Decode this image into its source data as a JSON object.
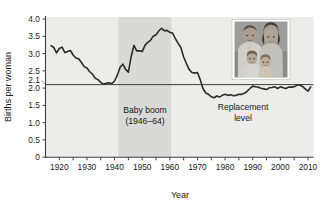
{
  "chart_data": {
    "type": "line",
    "title": "",
    "xlabel": "Year",
    "ylabel": "Births per woman",
    "xlim": [
      1915,
      2012
    ],
    "ylim": [
      0,
      4.1
    ],
    "grid": false,
    "legend": "none",
    "xticks_major": [
      1920,
      1930,
      1940,
      1950,
      1960,
      1970,
      1980,
      1990,
      2000,
      2010
    ],
    "xticks_minor": [
      1925,
      1935,
      1945,
      1955,
      1965,
      1975,
      1985,
      1995,
      2005
    ],
    "xtick_labels": [
      "1920",
      "1930",
      "1940",
      "1950",
      "1960",
      "1970",
      "1980",
      "1990",
      "2000",
      "2010"
    ],
    "yticks": [
      0,
      0.5,
      1.0,
      1.5,
      2.0,
      2.1,
      2.5,
      3.0,
      3.5,
      4.0
    ],
    "ytick_labels": [
      "0",
      "0.5",
      "1.0",
      "1.5",
      "2.0",
      "2.1",
      "2.5",
      "3.0",
      "3.5",
      "4.0"
    ],
    "series": [
      {
        "name": "Total fertility rate",
        "x": [
          1917,
          1918,
          1919,
          1920,
          1921,
          1922,
          1923,
          1924,
          1925,
          1926,
          1927,
          1928,
          1929,
          1930,
          1931,
          1932,
          1933,
          1934,
          1935,
          1936,
          1937,
          1938,
          1939,
          1940,
          1941,
          1942,
          1943,
          1944,
          1945,
          1946,
          1947,
          1948,
          1949,
          1950,
          1951,
          1952,
          1953,
          1954,
          1955,
          1956,
          1957,
          1958,
          1959,
          1960,
          1961,
          1962,
          1963,
          1964,
          1965,
          1966,
          1967,
          1968,
          1969,
          1970,
          1971,
          1972,
          1973,
          1974,
          1975,
          1976,
          1977,
          1978,
          1979,
          1980,
          1981,
          1982,
          1983,
          1984,
          1985,
          1986,
          1987,
          1988,
          1989,
          1990,
          1991,
          1992,
          1993,
          1994,
          1995,
          1996,
          1997,
          1998,
          1999,
          2000,
          2001,
          2002,
          2003,
          2004,
          2005,
          2006,
          2007,
          2008,
          2009,
          2010,
          2011
        ],
        "y": [
          3.26,
          3.21,
          3.05,
          3.18,
          3.22,
          3.06,
          3.09,
          3.12,
          2.99,
          2.9,
          2.88,
          2.77,
          2.65,
          2.61,
          2.5,
          2.43,
          2.31,
          2.27,
          2.19,
          2.14,
          2.16,
          2.18,
          2.15,
          2.23,
          2.4,
          2.63,
          2.72,
          2.57,
          2.49,
          2.94,
          3.27,
          3.11,
          3.11,
          3.09,
          3.27,
          3.36,
          3.42,
          3.54,
          3.58,
          3.69,
          3.77,
          3.7,
          3.71,
          3.65,
          3.63,
          3.47,
          3.33,
          3.21,
          2.93,
          2.74,
          2.57,
          2.48,
          2.46,
          2.48,
          2.27,
          2.01,
          1.88,
          1.84,
          1.77,
          1.74,
          1.79,
          1.76,
          1.81,
          1.84,
          1.81,
          1.83,
          1.8,
          1.81,
          1.84,
          1.84,
          1.87,
          1.93,
          2.01,
          2.08,
          2.06,
          2.05,
          2.02,
          2.0,
          1.98,
          2.03,
          2.04,
          2.06,
          2.01,
          2.06,
          2.03,
          2.01,
          2.05,
          2.05,
          2.06,
          2.11,
          2.12,
          2.07,
          2.0,
          1.93,
          2.06
        ]
      }
    ],
    "reference_lines": [
      {
        "name": "replacement-level",
        "orientation": "horizontal",
        "value": 2.1,
        "label": "2.1"
      }
    ],
    "shaded_regions": [
      {
        "name": "baby-boom-band",
        "x_start": 1946,
        "x_end": 1964,
        "label": "Baby boom",
        "sublabel": "(1946–64)"
      }
    ],
    "annotations": [
      {
        "name": "baby-boom-annotation",
        "line1": "Baby boom",
        "line2": "(1946–64)"
      },
      {
        "name": "replacement-annotation",
        "line1": "Replacement",
        "line2": "level"
      }
    ],
    "colors": {
      "plot_background": "#ececea",
      "band": "#d9d9d7",
      "line": "#2b2b2b",
      "axis": "#3d3d3d",
      "text": "#1a1a1a"
    }
  },
  "inset": {
    "name": "family-photo",
    "alt": "Black and white photograph of a family of four: a man, a woman and two small children"
  }
}
